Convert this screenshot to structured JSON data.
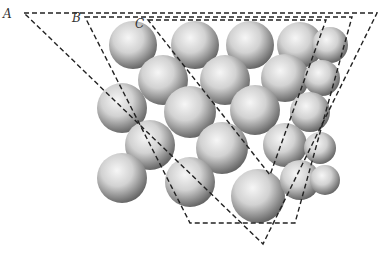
{
  "diagram": {
    "type": "crystal close-packed sphere stack with cutting planes",
    "labels": [
      {
        "id": "A",
        "text": "A",
        "x": 3,
        "y": 8
      },
      {
        "id": "B",
        "text": "B",
        "x": 72,
        "y": 12
      },
      {
        "id": "C",
        "text": "C",
        "x": 135,
        "y": 18
      }
    ],
    "planes": [
      {
        "name": "plane-A",
        "points": [
          [
            24,
            13
          ],
          [
            377,
            13
          ],
          [
            263,
            244
          ]
        ]
      },
      {
        "name": "plane-B",
        "points": [
          [
            85,
            17
          ],
          [
            352,
            17
          ],
          [
            295,
            223
          ],
          [
            190,
            223
          ]
        ]
      },
      {
        "name": "plane-C",
        "points": [
          [
            148,
            20
          ],
          [
            326,
            20
          ],
          [
            270,
            175
          ]
        ]
      }
    ],
    "spheres": [
      [
        133,
        45,
        24
      ],
      [
        195,
        45,
        24
      ],
      [
        250,
        45,
        24
      ],
      [
        300,
        45,
        23
      ],
      [
        330,
        45,
        18
      ],
      [
        163,
        80,
        25
      ],
      [
        225,
        80,
        25
      ],
      [
        285,
        78,
        24
      ],
      [
        322,
        78,
        18
      ],
      [
        122,
        108,
        25
      ],
      [
        190,
        112,
        26
      ],
      [
        255,
        110,
        25
      ],
      [
        310,
        112,
        20
      ],
      [
        150,
        145,
        25
      ],
      [
        222,
        148,
        26
      ],
      [
        285,
        145,
        22
      ],
      [
        320,
        148,
        16
      ],
      [
        122,
        178,
        25
      ],
      [
        190,
        182,
        25
      ],
      [
        258,
        196,
        27
      ],
      [
        300,
        180,
        20
      ],
      [
        325,
        180,
        15
      ]
    ],
    "colors": {
      "line": "#222222",
      "sphere_light": "#f4f4f4",
      "sphere_dark": "#555555"
    }
  }
}
